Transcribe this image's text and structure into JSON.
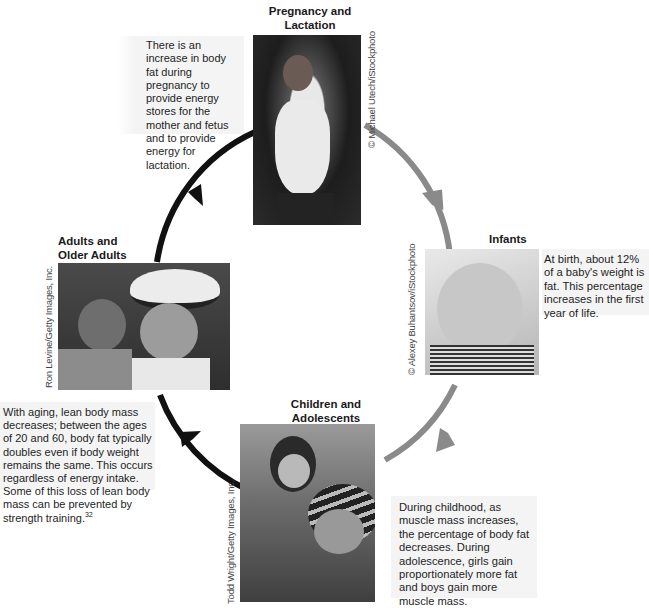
{
  "diagram": {
    "type": "life-cycle",
    "colors": {
      "arrow_dark": "#111111",
      "arrow_gray": "#8a8a8a",
      "text_box_bg": "#f4f4f4"
    },
    "stages": [
      {
        "id": "pregnancy",
        "title_line1": "Pregnancy and",
        "title_line2": "Lactation",
        "description": "There is an increase in body fat during pregnancy to provide energy stores for the mother and fetus and to provide energy for lactation.",
        "photo_alt": "Smiling pregnant woman in white tank top",
        "credit": "© Michael Utech/iStockphoto"
      },
      {
        "id": "infants",
        "title_line1": "Infants",
        "description": "At birth, about 12% of a baby's weight is fat. This percentage increases in the first year of life.",
        "photo_alt": "Baby chewing a teething ring",
        "credit": "© Alexey Buhantsov/iStockphoto"
      },
      {
        "id": "children",
        "title_line1": "Children and",
        "title_line2": "Adolescents",
        "description": "During childhood, as muscle mass increases, the percentage of body fat decreases. During adolescence, girls gain proportionately more fat and boys gain more muscle mass.",
        "photo_alt": "Teen boy giving young girl a piggyback ride",
        "credit": "Todd Wright/Getty Images, Inc."
      },
      {
        "id": "adults",
        "title_line1": "Adults and",
        "title_line2": "Older Adults",
        "description": "With aging, lean body mass decreases; between the ages of 20 and 60, body fat typically doubles even if body weight remains the same. This occurs regardless of energy intake. Some of this loss of lean body mass can be prevented by strength training.",
        "footnote": "32",
        "photo_alt": "Older man in hat with woman",
        "credit": "Ron Levine/Getty Images, Inc."
      }
    ]
  }
}
